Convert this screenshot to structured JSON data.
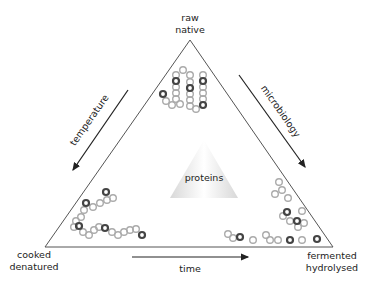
{
  "diagram": {
    "type": "protein-processing-triangle",
    "center_label": "proteins",
    "vertices": {
      "top": {
        "line1": "raw",
        "line2": "native"
      },
      "bottom_left": {
        "line1": "cooked",
        "line2": "denatured"
      },
      "bottom_right": {
        "line1": "fermented",
        "line2": "hydrolysed"
      }
    },
    "arrows": {
      "left": {
        "label": "temperature",
        "direction": "toward cooked/denatured"
      },
      "right": {
        "label": "microbiology",
        "direction": "toward fermented/hydrolysed"
      },
      "bottom": {
        "label": "time",
        "direction": "toward fermented/hydrolysed"
      }
    },
    "colors": {
      "line": "#555555",
      "arrow": "#222222",
      "open_bead": "#aaaaaa",
      "dark_bead": "#444444"
    }
  }
}
